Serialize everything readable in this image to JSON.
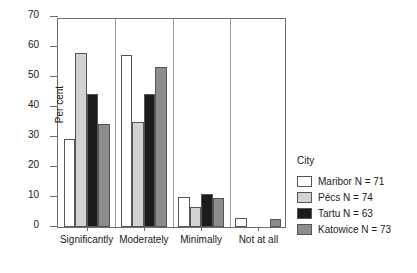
{
  "chart_data": {
    "type": "bar",
    "title": "",
    "subtitle": "",
    "xlabel": "",
    "ylabel": "Per cent",
    "ylim": [
      0,
      70
    ],
    "yticks": [
      0,
      10,
      20,
      30,
      40,
      50,
      60,
      70
    ],
    "ytick_labels": [
      "0",
      "10",
      "20",
      "30",
      "40",
      "50",
      "60",
      "70"
    ],
    "grid": false,
    "legend_position": "right",
    "legend_title": "City",
    "categories": [
      "Significantly",
      "Moderately",
      "Minimally",
      "Not at all"
    ],
    "series": [
      {
        "name": "Maribor N = 71",
        "city": "Maribor",
        "n": 71,
        "color": "#ffffff",
        "values": [
          29.5,
          57.5,
          9.9,
          3.0
        ]
      },
      {
        "name": "Pécs N = 74",
        "city": "Pécs",
        "n": 74,
        "color": "#d2d2d2",
        "values": [
          58.0,
          35.1,
          6.8,
          0.0
        ]
      },
      {
        "name": "Tartu N = 63",
        "city": "Tartu",
        "n": 63,
        "color": "#1c1c1c",
        "values": [
          44.5,
          44.5,
          11.0,
          0.0
        ]
      },
      {
        "name": "Katowice N = 73",
        "city": "Katowice",
        "n": 73,
        "color": "#8c8c8c",
        "values": [
          34.2,
          53.2,
          9.6,
          2.7
        ]
      }
    ]
  },
  "legend": {
    "title": "City",
    "items": [
      {
        "label": "Maribor N = 71",
        "color": "#ffffff"
      },
      {
        "label": "Pécs N = 74",
        "color": "#d2d2d2"
      },
      {
        "label": "Tartu N = 63",
        "color": "#1c1c1c"
      },
      {
        "label": "Katowice N = 73",
        "color": "#8c8c8c"
      }
    ]
  },
  "axes": {
    "y_label": "Per cent",
    "y_ticks": [
      "0",
      "10",
      "20",
      "30",
      "40",
      "50",
      "60",
      "70"
    ],
    "x_categories": [
      "Significantly",
      "Moderately",
      "Minimally",
      "Not at all"
    ]
  }
}
